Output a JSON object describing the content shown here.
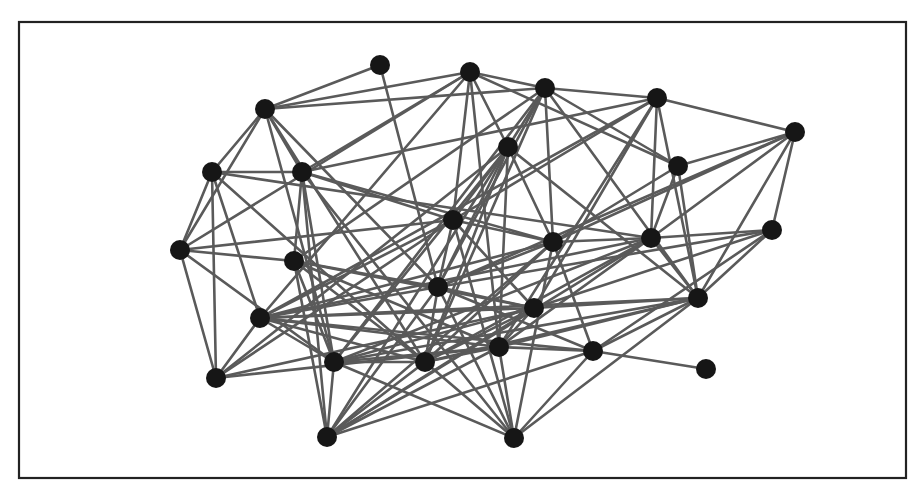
{
  "diagram": {
    "type": "network-graph",
    "frame": {
      "x": 19,
      "y": 22,
      "width": 887,
      "height": 456
    },
    "colors": {
      "node": "#161616",
      "edge": "#5a5a5a",
      "frame": "#222222",
      "background": "#ffffff"
    },
    "node_radius": 10,
    "nodes": [
      {
        "id": 0,
        "x": 380,
        "y": 65
      },
      {
        "id": 1,
        "x": 265,
        "y": 109
      },
      {
        "id": 2,
        "x": 470,
        "y": 72
      },
      {
        "id": 3,
        "x": 545,
        "y": 88
      },
      {
        "id": 4,
        "x": 657,
        "y": 98
      },
      {
        "id": 5,
        "x": 795,
        "y": 132
      },
      {
        "id": 6,
        "x": 508,
        "y": 147
      },
      {
        "id": 7,
        "x": 678,
        "y": 166
      },
      {
        "id": 8,
        "x": 212,
        "y": 172
      },
      {
        "id": 9,
        "x": 302,
        "y": 172
      },
      {
        "id": 10,
        "x": 180,
        "y": 250
      },
      {
        "id": 11,
        "x": 453,
        "y": 220
      },
      {
        "id": 12,
        "x": 553,
        "y": 242
      },
      {
        "id": 13,
        "x": 651,
        "y": 238
      },
      {
        "id": 14,
        "x": 772,
        "y": 230
      },
      {
        "id": 15,
        "x": 294,
        "y": 261
      },
      {
        "id": 16,
        "x": 438,
        "y": 287
      },
      {
        "id": 17,
        "x": 534,
        "y": 308
      },
      {
        "id": 18,
        "x": 698,
        "y": 298
      },
      {
        "id": 19,
        "x": 260,
        "y": 318
      },
      {
        "id": 20,
        "x": 216,
        "y": 378
      },
      {
        "id": 21,
        "x": 334,
        "y": 362
      },
      {
        "id": 22,
        "x": 425,
        "y": 362
      },
      {
        "id": 23,
        "x": 499,
        "y": 347
      },
      {
        "id": 24,
        "x": 593,
        "y": 351
      },
      {
        "id": 25,
        "x": 706,
        "y": 369
      },
      {
        "id": 26,
        "x": 327,
        "y": 437
      },
      {
        "id": 27,
        "x": 514,
        "y": 438
      }
    ],
    "edges": [
      [
        0,
        1
      ],
      [
        0,
        16
      ],
      [
        1,
        2
      ],
      [
        1,
        3
      ],
      [
        1,
        8
      ],
      [
        1,
        10
      ],
      [
        1,
        9
      ],
      [
        1,
        22
      ],
      [
        1,
        16
      ],
      [
        1,
        21
      ],
      [
        2,
        3
      ],
      [
        2,
        9
      ],
      [
        2,
        11
      ],
      [
        2,
        6
      ],
      [
        2,
        7
      ],
      [
        2,
        10
      ],
      [
        2,
        23
      ],
      [
        2,
        19
      ],
      [
        3,
        4
      ],
      [
        3,
        6
      ],
      [
        3,
        7
      ],
      [
        3,
        12
      ],
      [
        3,
        15
      ],
      [
        3,
        18
      ],
      [
        3,
        16
      ],
      [
        3,
        22
      ],
      [
        3,
        21
      ],
      [
        4,
        5
      ],
      [
        4,
        13
      ],
      [
        4,
        18
      ],
      [
        4,
        11
      ],
      [
        4,
        17
      ],
      [
        4,
        23
      ],
      [
        4,
        19
      ],
      [
        4,
        9
      ],
      [
        5,
        7
      ],
      [
        5,
        14
      ],
      [
        5,
        18
      ],
      [
        5,
        12
      ],
      [
        5,
        13
      ],
      [
        5,
        16
      ],
      [
        6,
        11
      ],
      [
        6,
        12
      ],
      [
        6,
        18
      ],
      [
        6,
        16
      ],
      [
        6,
        22
      ],
      [
        6,
        23
      ],
      [
        6,
        21
      ],
      [
        6,
        20
      ],
      [
        6,
        26
      ],
      [
        7,
        13
      ],
      [
        7,
        18
      ],
      [
        7,
        12
      ],
      [
        8,
        9
      ],
      [
        8,
        10
      ],
      [
        8,
        20
      ],
      [
        8,
        19
      ],
      [
        8,
        13
      ],
      [
        8,
        22
      ],
      [
        9,
        15
      ],
      [
        9,
        11
      ],
      [
        9,
        12
      ],
      [
        9,
        21
      ],
      [
        9,
        27
      ],
      [
        9,
        26
      ],
      [
        10,
        15
      ],
      [
        10,
        20
      ],
      [
        10,
        21
      ],
      [
        10,
        11
      ],
      [
        11,
        12
      ],
      [
        11,
        16
      ],
      [
        11,
        17
      ],
      [
        11,
        27
      ],
      [
        11,
        19
      ],
      [
        11,
        20
      ],
      [
        12,
        13
      ],
      [
        12,
        16
      ],
      [
        12,
        19
      ],
      [
        12,
        22
      ],
      [
        12,
        26
      ],
      [
        12,
        27
      ],
      [
        12,
        24
      ],
      [
        13,
        14
      ],
      [
        13,
        18
      ],
      [
        13,
        23
      ],
      [
        13,
        21
      ],
      [
        13,
        19
      ],
      [
        13,
        26
      ],
      [
        13,
        22
      ],
      [
        14,
        18
      ],
      [
        14,
        24
      ],
      [
        14,
        16
      ],
      [
        14,
        17
      ],
      [
        15,
        16
      ],
      [
        15,
        17
      ],
      [
        15,
        23
      ],
      [
        15,
        26
      ],
      [
        15,
        22
      ],
      [
        15,
        21
      ],
      [
        16,
        17
      ],
      [
        16,
        22
      ],
      [
        16,
        19
      ],
      [
        16,
        26
      ],
      [
        16,
        27
      ],
      [
        16,
        24
      ],
      [
        17,
        19
      ],
      [
        17,
        18
      ],
      [
        17,
        22
      ],
      [
        17,
        26
      ],
      [
        17,
        21
      ],
      [
        17,
        23
      ],
      [
        18,
        19
      ],
      [
        18,
        22
      ],
      [
        18,
        23
      ],
      [
        18,
        24
      ],
      [
        18,
        27
      ],
      [
        18,
        21
      ],
      [
        19,
        20
      ],
      [
        19,
        21
      ],
      [
        19,
        23
      ],
      [
        19,
        24
      ],
      [
        19,
        22
      ],
      [
        20,
        23
      ],
      [
        20,
        17
      ],
      [
        21,
        22
      ],
      [
        21,
        26
      ],
      [
        21,
        23
      ],
      [
        21,
        27
      ],
      [
        22,
        23
      ],
      [
        22,
        26
      ],
      [
        22,
        27
      ],
      [
        23,
        24
      ],
      [
        23,
        27
      ],
      [
        23,
        26
      ],
      [
        24,
        25
      ],
      [
        24,
        27
      ],
      [
        24,
        26
      ]
    ]
  }
}
